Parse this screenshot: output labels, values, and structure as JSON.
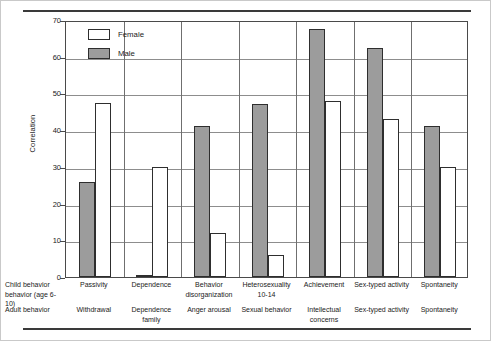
{
  "chart_data": {
    "type": "bar",
    "title": "",
    "xlabel": "",
    "ylabel": "Correlation",
    "ylim": [
      0,
      70
    ],
    "ytick_labels": [
      "70",
      "60",
      "50",
      "40",
      "30",
      "20",
      "10",
      "0"
    ],
    "yticks": [
      70,
      60,
      50,
      40,
      30,
      20,
      10,
      0
    ],
    "grid": "horizontal",
    "legend_position": "top-left inside plot",
    "categories": [
      "Passivity",
      "Dependence",
      "Behavior disorganization",
      "Heterosexuality 10-14",
      "Achievement",
      "Sex-typed activity",
      "Spontaneity"
    ],
    "series": [
      {
        "name": "Male",
        "color": "#9c9c9c",
        "values": [
          26,
          0.5,
          41,
          47,
          67.5,
          62.5,
          41
        ]
      },
      {
        "name": "Female",
        "color": "#ffffff",
        "values": [
          47.5,
          30,
          12,
          6,
          48,
          43,
          30
        ]
      }
    ],
    "bar_order_in_group": [
      "Male",
      "Female"
    ],
    "axis_row_labels": {
      "child": [
        "Child behavior",
        "behavior (age 6-10)"
      ],
      "adult": [
        "Adult behavior"
      ]
    },
    "child_behavior_labels": [
      [
        "Passivity"
      ],
      [
        "Dependence"
      ],
      [
        "Behavior",
        "disorganization"
      ],
      [
        "Heterosexuality",
        "10-14"
      ],
      [
        "Achievement"
      ],
      [
        "Sex-typed activity"
      ],
      [
        "Spontaneity"
      ]
    ],
    "adult_behavior_labels": [
      [
        "Withdrawal"
      ],
      [
        "Dependence",
        "family"
      ],
      [
        "Anger arousal"
      ],
      [
        "Sexual behavior"
      ],
      [
        "Intellectual",
        "concerns"
      ],
      [
        "Sex-typed activity"
      ],
      [
        "Spontaneity"
      ]
    ]
  },
  "legend": {
    "items": [
      {
        "label": "Female",
        "swatch": "female"
      },
      {
        "label": "Male",
        "swatch": "male"
      }
    ]
  },
  "axis": {
    "ylabel": "Correlation",
    "ytick_labels": [
      "70",
      "60",
      "50",
      "40",
      "30",
      "20",
      "10",
      "0"
    ]
  },
  "rowlabels": {
    "child_line1": "Child behavior",
    "child_line2": "behavior (age 6-10)",
    "adult_line1": "Adult behavior"
  },
  "colors": {
    "male_fill": "#9c9c9c",
    "female_fill": "#ffffff",
    "bar_stroke": "#2e2e2e",
    "gridline": "#8d8d8d",
    "rule": "#3a3a3a"
  }
}
